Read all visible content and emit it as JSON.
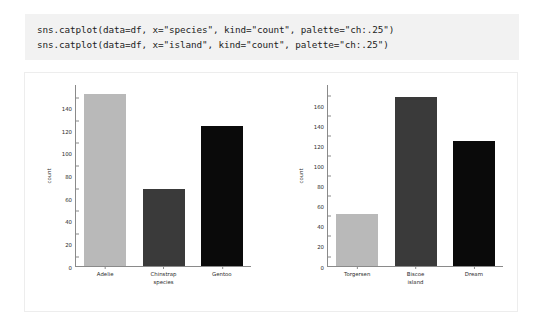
{
  "code_block": {
    "background": "#f2f2f2",
    "lines": [
      "sns.catplot(data=df, x=\"species\", kind=\"count\", palette=\"ch:.25\")",
      "sns.catplot(data=df, x=\"island\", kind=\"count\", palette=\"ch:.25\")"
    ]
  },
  "figure": {
    "background": "#ffffff",
    "border_color": "#ededed",
    "axis_color": "#8a8a8a",
    "tick_text_color": "#2b2b2b"
  },
  "chart_data": [
    {
      "type": "bar",
      "name": "species-count",
      "title": "",
      "xlabel": "species",
      "ylabel": "count",
      "categories": [
        "Adelie",
        "Chinstrap",
        "Gentoo"
      ],
      "values": [
        152,
        68,
        124
      ],
      "colors": [
        "#b9b9b9",
        "#3a3a3a",
        "#0a0a0a"
      ],
      "ylim": [
        0,
        160
      ],
      "yticks": [
        0,
        20,
        40,
        60,
        80,
        100,
        120,
        140
      ],
      "grid": false,
      "legend": "none"
    },
    {
      "type": "bar",
      "name": "island-count",
      "title": "",
      "xlabel": "island",
      "ylabel": "count",
      "categories": [
        "Torgersen",
        "Biscoe",
        "Dream"
      ],
      "values": [
        52,
        168,
        124
      ],
      "colors": [
        "#b9b9b9",
        "#3a3a3a",
        "#0a0a0a"
      ],
      "ylim": [
        0,
        180
      ],
      "yticks": [
        0,
        20,
        40,
        60,
        80,
        100,
        120,
        140,
        160
      ],
      "grid": false,
      "legend": "none"
    }
  ]
}
